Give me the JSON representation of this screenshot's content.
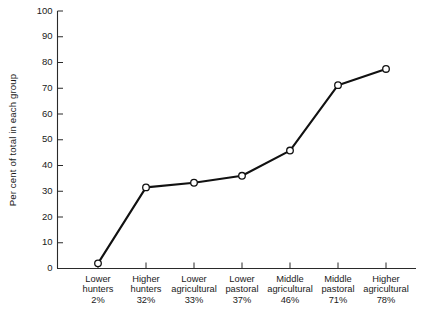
{
  "chart_data": {
    "type": "line",
    "title": "",
    "subtitle": "",
    "xlabel": "",
    "ylabel": "Per cent of total in each group",
    "ylim": [
      0,
      100
    ],
    "yticks": [
      0,
      10,
      20,
      30,
      40,
      50,
      60,
      70,
      80,
      90,
      100
    ],
    "ytick_labels": [
      "0",
      "10",
      "20",
      "30",
      "40",
      "50",
      "60",
      "70",
      "80",
      "90",
      "100"
    ],
    "grid": false,
    "legend": null,
    "marker": "open-circle",
    "line_color": "#111111",
    "marker_face_color": "#ffffff",
    "categories": [
      "Lower hunters 2%",
      "Higher hunters 32%",
      "Lower agricultural 33%",
      "Lower pastoral 37%",
      "Middle agricultural 46%",
      "Middle pastoral 71%",
      "Higher agricultural 78%"
    ],
    "category_lines": [
      {
        "line1": "Lower",
        "line2": "hunters",
        "line3": "2%"
      },
      {
        "line1": "Higher",
        "line2": "hunters",
        "line3": "32%"
      },
      {
        "line1": "Lower",
        "line2": "agricultural",
        "line3": "33%"
      },
      {
        "line1": "Lower",
        "line2": "pastoral",
        "line3": "37%"
      },
      {
        "line1": "Middle",
        "line2": "agricultural",
        "line3": "46%"
      },
      {
        "line1": "Middle",
        "line2": "pastoral",
        "line3": "71%"
      },
      {
        "line1": "Higher",
        "line2": "agricultural",
        "line3": "78%"
      }
    ],
    "values": [
      2,
      31.5,
      33.3,
      36,
      45.8,
      71.2,
      77.5
    ],
    "series": [
      {
        "name": "Per cent of total in each group",
        "values": [
          2,
          31.5,
          33.3,
          36,
          45.8,
          71.2,
          77.5
        ]
      }
    ]
  }
}
